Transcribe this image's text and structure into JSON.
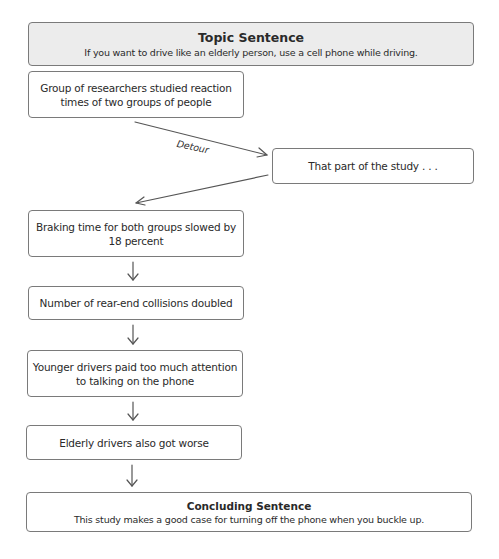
{
  "diagram": {
    "topic": {
      "heading": "Topic Sentence",
      "text": "If you want to drive like an elderly person, use a cell phone while driving."
    },
    "steps": [
      {
        "line1": "Group of researchers studied reaction",
        "line2": "times of two groups of people"
      },
      {
        "line1": "That part of the study . . ."
      },
      {
        "line1": "Braking time for both groups slowed by",
        "line2": "18 percent"
      },
      {
        "line1": "Number of rear-end collisions doubled"
      },
      {
        "line1": "Younger drivers paid too much attention",
        "line2": "to talking on the phone"
      },
      {
        "line1": "Elderly drivers also got worse"
      }
    ],
    "detour_label": "Detour",
    "conclusion": {
      "heading": "Concluding Sentence",
      "text": "This study makes a good case for turning off the phone when you buckle up."
    },
    "colors": {
      "border": "#7a7a7a",
      "header_fill": "#ececec",
      "arrow": "#555555"
    }
  }
}
